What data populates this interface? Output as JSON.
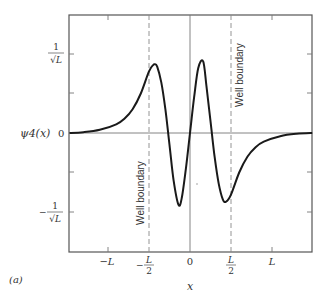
{
  "figure_label": "(a)",
  "chart_data": {
    "type": "line",
    "title": "",
    "xlabel": "x",
    "ylabel": "ψ4(x)",
    "function": "ψ4(x) — fourth eigenfunction of a finite square well (odd parity, four lobes)",
    "x_unit": "L",
    "xlim": [
      -1.47,
      1.49
    ],
    "ylim": [
      -1.5,
      1.5
    ],
    "grid": false,
    "legend": null,
    "x_ticks": [
      {
        "value": -1.0,
        "label": "−L"
      },
      {
        "value": -0.5,
        "label": "−L/2"
      },
      {
        "value": 0.0,
        "label": "0"
      },
      {
        "value": 0.5,
        "label": "L/2"
      },
      {
        "value": 1.0,
        "label": "L"
      }
    ],
    "y_ticks": [
      {
        "value": 1.0,
        "label": "1/√L"
      },
      {
        "value": 0.5,
        "label": ""
      },
      {
        "value": 0.0,
        "label": "0"
      },
      {
        "value": -0.5,
        "label": ""
      },
      {
        "value": -1.0,
        "label": "−1/√L"
      }
    ],
    "reference_lines": [
      {
        "orientation": "vertical",
        "x": -0.5,
        "style": "dashed",
        "label": "Well boundary"
      },
      {
        "orientation": "vertical",
        "x": 0.5,
        "style": "dashed",
        "label": "Well boundary"
      },
      {
        "orientation": "vertical",
        "x": 0.0,
        "style": "solid",
        "label": ""
      },
      {
        "orientation": "horizontal",
        "y": 0.0,
        "style": "solid",
        "label": ""
      }
    ],
    "extrema": [
      {
        "x": -0.43,
        "y": 0.87,
        "kind": "max"
      },
      {
        "x": -0.14,
        "y": -0.91,
        "kind": "min"
      },
      {
        "x": 0.16,
        "y": 0.91,
        "kind": "max"
      },
      {
        "x": 0.44,
        "y": -0.87,
        "kind": "min"
      }
    ],
    "x": [
      -1.47,
      -1.3,
      -1.1,
      -0.9,
      -0.8,
      -0.7,
      -0.6,
      -0.5,
      -0.45,
      -0.43,
      -0.4,
      -0.35,
      -0.3,
      -0.25,
      -0.2,
      -0.14,
      -0.1,
      -0.05,
      0.0,
      0.05,
      0.1,
      0.16,
      0.2,
      0.25,
      0.3,
      0.35,
      0.4,
      0.44,
      0.5,
      0.6,
      0.7,
      0.8,
      0.9,
      1.1,
      1.3,
      1.49
    ],
    "values": [
      0.0,
      0.01,
      0.04,
      0.11,
      0.18,
      0.3,
      0.5,
      0.78,
      0.86,
      0.87,
      0.84,
      0.64,
      0.3,
      -0.15,
      -0.6,
      -0.91,
      -0.82,
      -0.45,
      0.0,
      0.45,
      0.82,
      0.91,
      0.6,
      0.15,
      -0.3,
      -0.64,
      -0.84,
      -0.87,
      -0.78,
      -0.5,
      -0.3,
      -0.18,
      -0.11,
      -0.04,
      -0.01,
      0.0
    ]
  },
  "labels": {
    "y_axis_name": "ψ4(x)",
    "y_zero": "0",
    "y_pos_num": "1",
    "y_pos_den": "√L",
    "y_neg_sign": "−",
    "y_neg_num": "1",
    "y_neg_den": "√L",
    "x_neg_L": "−L",
    "x_neg_half_sign": "−",
    "x_neg_half_num": "L",
    "x_neg_half_den": "2",
    "x_zero": "0",
    "x_pos_half_num": "L",
    "x_pos_half_den": "2",
    "x_pos_L": "L",
    "x_axis_name": "x",
    "well_left": "Well boundary",
    "well_right": "Well boundary"
  },
  "colors": {
    "curve": "#1a1a1a",
    "frame": "#555555",
    "axis": "#777777",
    "dashed": "#888888",
    "text": "#333333"
  }
}
